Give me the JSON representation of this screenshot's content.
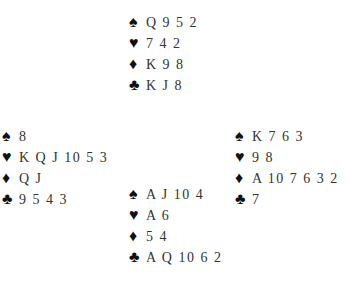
{
  "deal": {
    "north": {
      "spades": "Q 9 5 2",
      "hearts": "7 4 2",
      "diamonds": "K 9 8",
      "clubs": "K J 8"
    },
    "west": {
      "spades": "8",
      "hearts": "K Q J 10 5 3",
      "diamonds": "Q J",
      "clubs": "9 5 4 3"
    },
    "east": {
      "spades": "K 7 6 3",
      "hearts": "9 8",
      "diamonds": "A 10 7 6 3 2",
      "clubs": "7"
    },
    "south": {
      "spades": "A J 10 4",
      "hearts": "A 6",
      "diamonds": "5 4",
      "clubs": "A Q 10 6 2"
    }
  },
  "suits": {
    "spades": "♠",
    "hearts": "♥",
    "diamonds": "♦",
    "clubs": "♣"
  }
}
